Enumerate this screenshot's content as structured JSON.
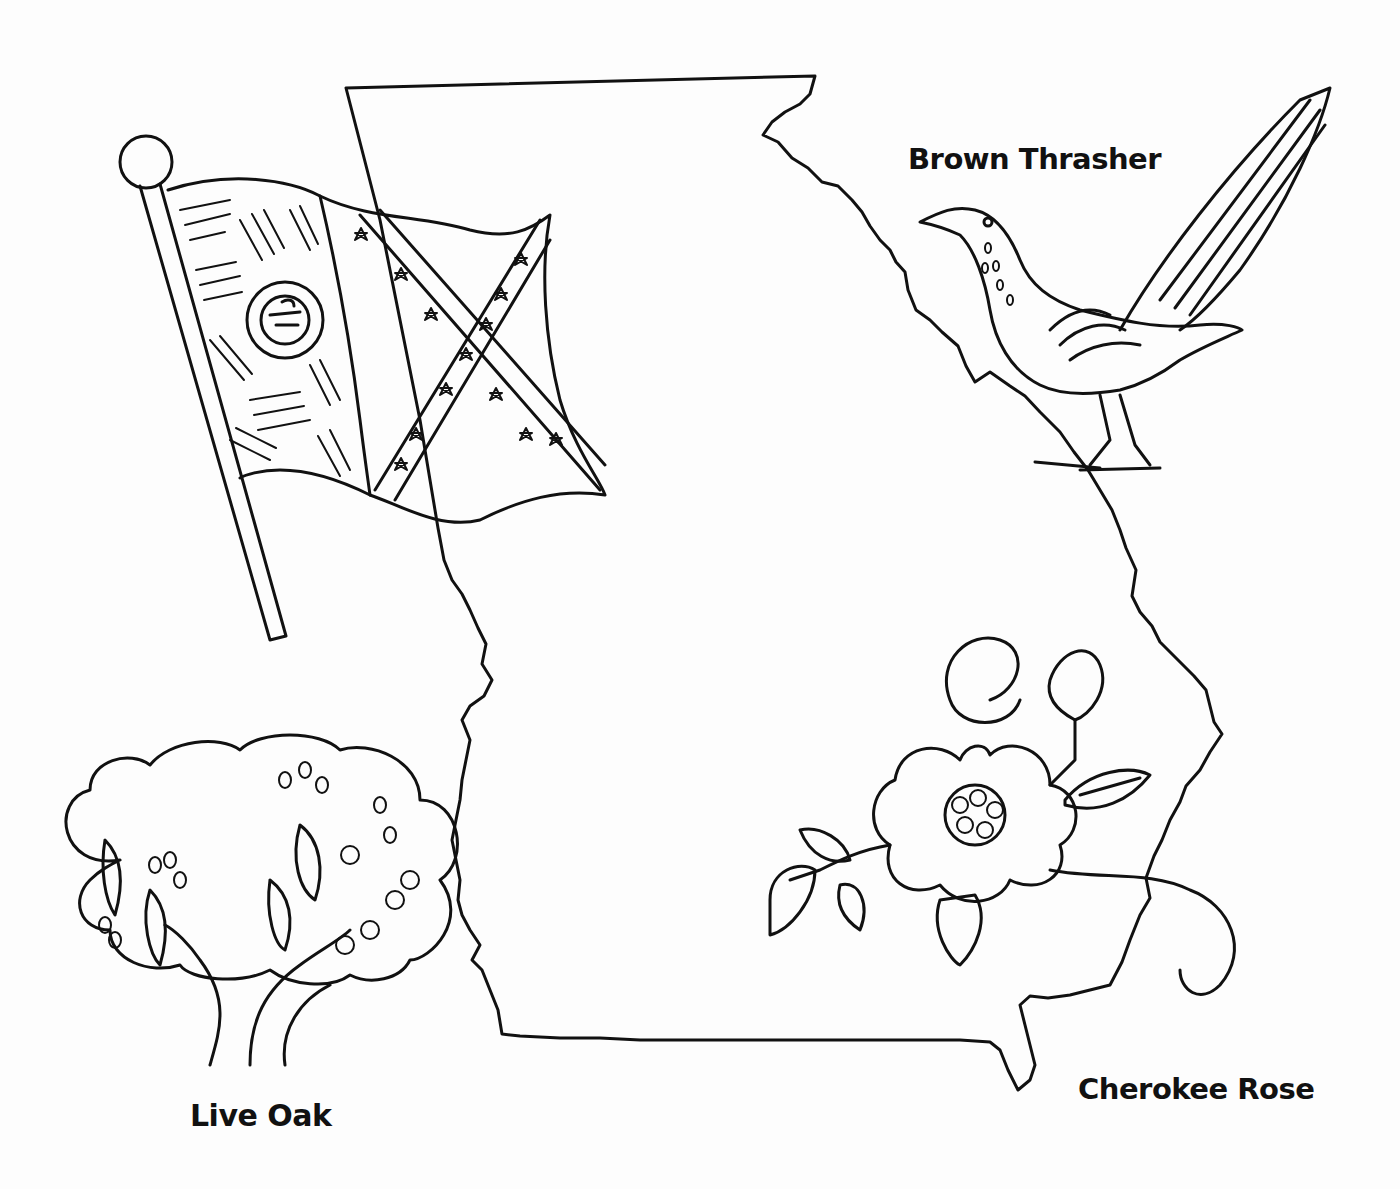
{
  "page": {
    "line_color": "#111111",
    "background_color": "#fdfdfd"
  },
  "labels": {
    "bird": "Brown Thrasher",
    "tree": "Live Oak",
    "flower": "Cherokee Rose"
  },
  "illustrations": [
    {
      "name": "state-map-outline"
    },
    {
      "name": "state-flag"
    },
    {
      "name": "brown-thrasher-bird"
    },
    {
      "name": "cherokee-rose-flower"
    },
    {
      "name": "live-oak-tree"
    }
  ]
}
